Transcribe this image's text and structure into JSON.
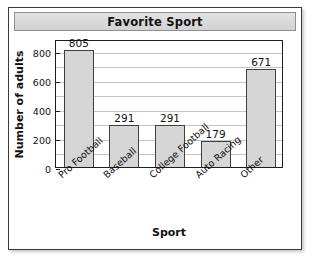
{
  "chart_data": {
    "type": "bar",
    "title": "Favorite Sport",
    "xlabel": "Sport",
    "ylabel": "Number of adults",
    "categories": [
      "Pro Football",
      "Baseball",
      "College Football",
      "Auto Racing",
      "Other"
    ],
    "values": [
      805,
      291,
      291,
      179,
      671
    ],
    "value_labels": [
      "805",
      "291",
      "291",
      "179",
      "671"
    ],
    "ylim": [
      0,
      880
    ],
    "ytick_values": [
      0,
      200,
      400,
      600,
      800
    ],
    "ytick_labels": [
      "0",
      "200",
      "400",
      "600",
      "800"
    ],
    "gridline_values": [
      100,
      200,
      300,
      400,
      500,
      600,
      700,
      800
    ],
    "grid": true,
    "legend": false,
    "bar_color": "#d6d6d6",
    "bar_border_color": "#3f3f3f",
    "plot_border_color": "#1d1d1d",
    "gridline_color": "#c4c4c4",
    "title_banner_color": "#dadada",
    "text_color": "#111111",
    "xtick_rotation": "-42"
  }
}
